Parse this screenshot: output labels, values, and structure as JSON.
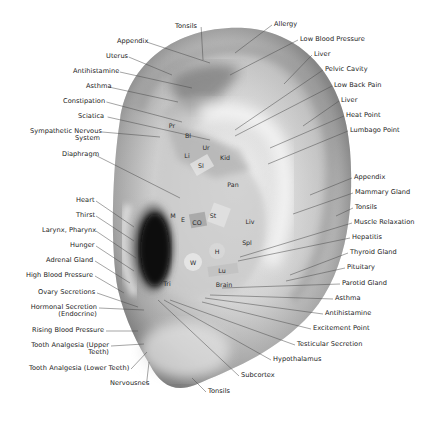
{
  "diagram": {
    "title": "",
    "colors": {
      "background": "#ffffff",
      "label_text": "#222222",
      "leader_line": "#555555",
      "ear_skin_light": "#e8e8e8",
      "ear_skin_mid": "#b5b5b5",
      "ear_canal": "#0e0e0e"
    },
    "left_labels": [
      {
        "text": "Tonsils",
        "x": 175,
        "y": 27,
        "tx": 203,
        "ty": 60,
        "align": "l"
      },
      {
        "text": "Appendix",
        "x": 117,
        "y": 42,
        "tx": 210,
        "ty": 63,
        "align": "l"
      },
      {
        "text": "Uterus",
        "x": 106,
        "y": 57,
        "tx": 172,
        "ty": 75,
        "align": "l"
      },
      {
        "text": "Antihistamine",
        "x": 73,
        "y": 72,
        "tx": 192,
        "ty": 88,
        "align": "l"
      },
      {
        "text": "Asthma",
        "x": 86,
        "y": 87,
        "tx": 178,
        "ty": 102,
        "align": "l"
      },
      {
        "text": "Constipation",
        "x": 63,
        "y": 102,
        "tx": 182,
        "ty": 122,
        "align": "l"
      },
      {
        "text": "Sciatica",
        "x": 78,
        "y": 117,
        "tx": 210,
        "ty": 140,
        "align": "l"
      },
      {
        "text": "Sympathetic Nervous\nSystem",
        "x": 30,
        "y": 132,
        "tx": 160,
        "ty": 137,
        "align": "r",
        "w": 70
      },
      {
        "text": "Diaphragm",
        "x": 62,
        "y": 155,
        "tx": 180,
        "ty": 198,
        "align": "l"
      },
      {
        "text": "Heart",
        "x": 76,
        "y": 201,
        "tx": 134,
        "ty": 227,
        "align": "r",
        "w": 18
      },
      {
        "text": "Thirst",
        "x": 76,
        "y": 216,
        "tx": 134,
        "ty": 241,
        "align": "r",
        "w": 18
      },
      {
        "text": "Larynx, Pharynx",
        "x": 42,
        "y": 231,
        "tx": 136,
        "ty": 258,
        "align": "r",
        "w": 52
      },
      {
        "text": "Hunger",
        "x": 70,
        "y": 246,
        "tx": 134,
        "ty": 271,
        "align": "r",
        "w": 24
      },
      {
        "text": "Adrenal Gland",
        "x": 46,
        "y": 261,
        "tx": 130,
        "ty": 283,
        "align": "r",
        "w": 47
      },
      {
        "text": "High Blood Pressure",
        "x": 25,
        "y": 276,
        "tx": 124,
        "ty": 293,
        "align": "r",
        "w": 68
      },
      {
        "text": "Ovary Secretions",
        "x": 38,
        "y": 293,
        "tx": 138,
        "ty": 307,
        "align": "r",
        "w": 57
      },
      {
        "text": "Hormonal Secretion\n(Endocrine)",
        "x": 29,
        "y": 308,
        "tx": 144,
        "ty": 310,
        "align": "r",
        "w": 68
      },
      {
        "text": "Rising Blood Pressure",
        "x": 32,
        "y": 331,
        "tx": 138,
        "ty": 331,
        "align": "r",
        "w": 72
      },
      {
        "text": "Tooth Analgesia (Upper\nTeeth)",
        "x": 30,
        "y": 346,
        "tx": 144,
        "ty": 344,
        "align": "r",
        "w": 79
      },
      {
        "text": "Tooth Analgesia (Lower Teeth)",
        "x": 29,
        "y": 369,
        "tx": 147,
        "ty": 352,
        "align": "l"
      },
      {
        "text": "Nervousnes",
        "x": 110,
        "y": 384,
        "tx": 149,
        "ty": 362,
        "align": "l"
      }
    ],
    "right_labels": [
      {
        "text": "Allergy",
        "x": 274,
        "y": 25,
        "tx": 235,
        "ty": 53
      },
      {
        "text": "Low Blood Pressure",
        "x": 300,
        "y": 40,
        "tx": 230,
        "ty": 75
      },
      {
        "text": "Liver",
        "x": 314,
        "y": 55,
        "tx": 284,
        "ty": 84
      },
      {
        "text": "Pelvic Cavity",
        "x": 325,
        "y": 70,
        "tx": 235,
        "ty": 130
      },
      {
        "text": "Low Back Pain",
        "x": 334,
        "y": 86,
        "tx": 235,
        "ty": 136
      },
      {
        "text": "Liver",
        "x": 341,
        "y": 101,
        "tx": 303,
        "ty": 126
      },
      {
        "text": "Heat Point",
        "x": 346,
        "y": 116,
        "tx": 270,
        "ty": 148
      },
      {
        "text": "Lumbago Point",
        "x": 350,
        "y": 131,
        "tx": 268,
        "ty": 164
      },
      {
        "text": "Appendix",
        "x": 354,
        "y": 178,
        "tx": 310,
        "ty": 195
      },
      {
        "text": "Mammary Gland",
        "x": 355,
        "y": 193,
        "tx": 293,
        "ty": 214
      },
      {
        "text": "Tonsils",
        "x": 355,
        "y": 208,
        "tx": 336,
        "ty": 216
      },
      {
        "text": "Muscle Relaxation",
        "x": 354,
        "y": 223,
        "tx": 240,
        "ty": 257
      },
      {
        "text": "Hepatitis",
        "x": 352,
        "y": 238,
        "tx": 238,
        "ty": 261
      },
      {
        "text": "Thyroid Gland",
        "x": 350,
        "y": 253,
        "tx": 290,
        "ty": 275
      },
      {
        "text": "Pituitary",
        "x": 347,
        "y": 268,
        "tx": 286,
        "ty": 281
      },
      {
        "text": "Parotid Gland",
        "x": 342,
        "y": 284,
        "tx": 222,
        "ty": 288
      },
      {
        "text": "Asthma",
        "x": 335,
        "y": 299,
        "tx": 210,
        "ty": 295
      },
      {
        "text": "Antihistamine",
        "x": 325,
        "y": 314,
        "tx": 205,
        "ty": 298
      },
      {
        "text": "Excitement Point",
        "x": 313,
        "y": 329,
        "tx": 202,
        "ty": 302
      },
      {
        "text": "Testicular Secretion",
        "x": 297,
        "y": 345,
        "tx": 170,
        "ty": 300
      },
      {
        "text": "Hypothalamus",
        "x": 273,
        "y": 360,
        "tx": 164,
        "ty": 300
      },
      {
        "text": "Subcortex",
        "x": 241,
        "y": 376,
        "tx": 158,
        "ty": 300
      },
      {
        "text": "Tonsils",
        "x": 208,
        "y": 392,
        "tx": 192,
        "ty": 378
      }
    ],
    "zones": [
      {
        "text": "Pr",
        "x": 172,
        "y": 125
      },
      {
        "text": "Bl",
        "x": 188,
        "y": 135
      },
      {
        "text": "Ur",
        "x": 206,
        "y": 147
      },
      {
        "text": "Li",
        "x": 187,
        "y": 155
      },
      {
        "text": "Kid",
        "x": 225,
        "y": 157
      },
      {
        "text": "SI",
        "x": 201,
        "y": 165
      },
      {
        "text": "Pan",
        "x": 233,
        "y": 184
      },
      {
        "text": "M",
        "x": 173,
        "y": 215
      },
      {
        "text": "E",
        "x": 183,
        "y": 219
      },
      {
        "text": "CO",
        "x": 197,
        "y": 222
      },
      {
        "text": "St",
        "x": 213,
        "y": 215
      },
      {
        "text": "Liv",
        "x": 250,
        "y": 221
      },
      {
        "text": "Spl",
        "x": 247,
        "y": 242
      },
      {
        "text": "H",
        "x": 217,
        "y": 251
      },
      {
        "text": "W",
        "x": 193,
        "y": 262
      },
      {
        "text": "Lu",
        "x": 222,
        "y": 270
      },
      {
        "text": "Tri",
        "x": 167,
        "y": 283
      },
      {
        "text": "Brain",
        "x": 224,
        "y": 284
      }
    ]
  }
}
